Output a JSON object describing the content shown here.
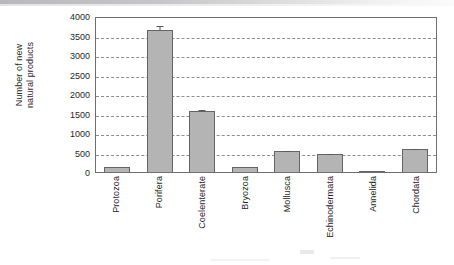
{
  "chart_data": {
    "type": "bar",
    "title": "",
    "subtitle": "",
    "xlabel": "",
    "ylabel": "Number of new natural products",
    "ylabel_line1": "Number of new",
    "ylabel_line2": "natural products",
    "categories": [
      "Protozoa",
      "Porifera",
      "Coelenterate",
      "Bryozoa",
      "Mollusca",
      "Echinodermata",
      "Annelida",
      "Chordata"
    ],
    "values": [
      120,
      3630,
      1570,
      135,
      545,
      465,
      30,
      580
    ],
    "errors": [
      0,
      135,
      45,
      0,
      20,
      25,
      0,
      35
    ],
    "ylim": [
      0,
      4000
    ],
    "ytick_labels": [
      "0",
      "500",
      "1000",
      "1500",
      "2000",
      "2500",
      "3000",
      "3500",
      "4000"
    ],
    "yticks": [
      0,
      500,
      1000,
      1500,
      2000,
      2500,
      3000,
      3500,
      4000
    ],
    "grid": "horizontal-dashed",
    "legend": "none",
    "bar_color": "#b4b4b4",
    "bar_edge_color": "#646464",
    "grid_color": "#8e8e8e",
    "axis_color": "#6f6f6f"
  }
}
